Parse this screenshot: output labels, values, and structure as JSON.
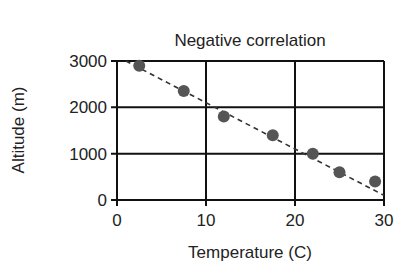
{
  "chart_data": {
    "type": "scatter",
    "title": "Negative correlation",
    "xlabel": "Temperature (C)",
    "ylabel": "Altitude (m)",
    "xlim": [
      0,
      30
    ],
    "ylim": [
      0,
      3000
    ],
    "x_ticks": [
      "0",
      "10",
      "20",
      "30"
    ],
    "y_ticks": [
      "0",
      "1000",
      "2000",
      "3000"
    ],
    "grid": true,
    "legend": null,
    "series": [
      {
        "name": "Data points",
        "x": [
          2.5,
          7.5,
          12,
          17.5,
          22,
          25,
          29
        ],
        "y": [
          2900,
          2350,
          1800,
          1400,
          1000,
          600,
          400
        ]
      }
    ],
    "trend_line": {
      "style": "dashed",
      "from": [
        1,
        3000
      ],
      "to": [
        30,
        100
      ]
    },
    "colors": {
      "points": "#555555",
      "grid": "#111111",
      "trend": "#333333"
    }
  }
}
